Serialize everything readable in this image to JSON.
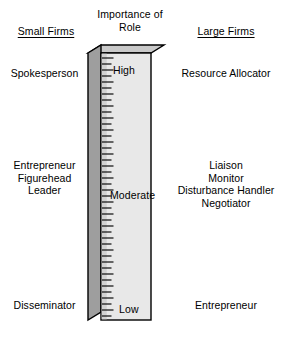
{
  "figure": {
    "title": "Importance of Role",
    "title_line1": "Importance of",
    "title_line2": "Role"
  },
  "headers": {
    "left": "Small Firms",
    "center": "Importance of\nRole",
    "right": "Large Firms"
  },
  "scale": {
    "high": "High",
    "moderate": "Moderate",
    "low": "Low",
    "tick_count": 44
  },
  "left_column": {
    "high_roles": "Spokesperson",
    "moderate_roles": "Entrepreneur\nFigurehead\nLeader",
    "low_roles": "Disseminator"
  },
  "right_column": {
    "high_roles": "Resource Allocator",
    "moderate_roles": "Liaison\nMonitor\nDisturbance Handler\nNegotiator",
    "low_roles": "Entrepreneur"
  },
  "colors": {
    "background": "#ffffff",
    "text": "#000000",
    "column_front": "#e6e6e6",
    "column_side": "#9a9a9a",
    "column_top": "#c9c9c9",
    "outline": "#000000",
    "tick": "#1a1a1a"
  },
  "chart_data": {
    "type": "bar",
    "title": "Importance of Role",
    "xlabel": "",
    "ylabel": "Importance of Role",
    "categories": [
      "High",
      "Moderate",
      "Low"
    ],
    "series": [
      {
        "name": "Small Firms",
        "values": [
          "Spokesperson",
          "Entrepreneur, Figurehead, Leader",
          "Disseminator"
        ]
      },
      {
        "name": "Large Firms",
        "values": [
          "Resource Allocator",
          "Liaison, Monitor, Disturbance Handler, Negotiator",
          "Entrepreneur"
        ]
      }
    ],
    "axis_ticks": [
      "High",
      "Moderate",
      "Low"
    ],
    "grid": false,
    "legend": "none"
  }
}
